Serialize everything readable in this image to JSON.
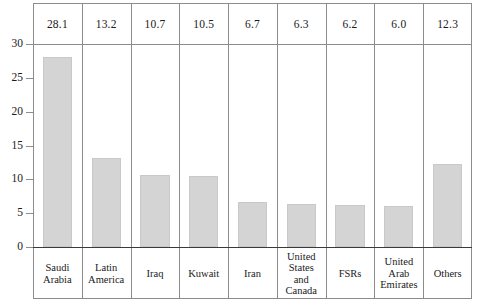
{
  "chart_data": {
    "type": "bar",
    "title": "",
    "xlabel": "",
    "ylabel": "",
    "ylim": [
      0,
      30
    ],
    "yticks": [
      0,
      5,
      10,
      15,
      20,
      25,
      30
    ],
    "grid": false,
    "legend": "none",
    "value_labels_position": "top-row-table",
    "categories": [
      "Saudi Arabia",
      "Latin America",
      "Iraq",
      "Kuwait",
      "Iran",
      "United States and Canada",
      "FSRs",
      "United Arab Emirates",
      "Others"
    ],
    "category_lines": [
      [
        "Saudi",
        "Arabia"
      ],
      [
        "Latin",
        "America"
      ],
      [
        "Iraq"
      ],
      [
        "Kuwait"
      ],
      [
        "Iran"
      ],
      [
        "United",
        "States",
        "and",
        "Canada"
      ],
      [
        "FSRs"
      ],
      [
        "United",
        "Arab",
        "Emirates"
      ],
      [
        "Others"
      ]
    ],
    "values": [
      28.1,
      13.2,
      10.7,
      10.5,
      6.7,
      6.3,
      6.2,
      6.0,
      12.3
    ],
    "value_labels": [
      "28.1",
      "13.2",
      "10.7",
      "10.5",
      "6.7",
      "6.3",
      "6.2",
      "6.0",
      "12.3"
    ],
    "ytick_labels": [
      "0",
      "5",
      "10",
      "15",
      "20",
      "25",
      "30"
    ]
  },
  "colors": {
    "bar_fill": "#d4d4d4",
    "bar_border": "#c9c9c9",
    "frame": "#8c8c8c",
    "baseline": "#3a3a3a",
    "text": "#1a1a1a",
    "background": "#ffffff"
  }
}
